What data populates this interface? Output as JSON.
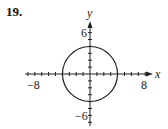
{
  "problem": {
    "number": "19."
  },
  "graph": {
    "x_axis_label": "x",
    "y_axis_label": "y",
    "tick_labels": {
      "x_min": "−8",
      "x_max": "8",
      "y_max": "6",
      "y_min": "−6"
    },
    "colors": {
      "stroke": "#222222",
      "background": "#ffffff"
    }
  },
  "chart_data": {
    "type": "line",
    "title": "",
    "xlabel": "x",
    "ylabel": "y",
    "xlim": [
      -9,
      9
    ],
    "ylim": [
      -7,
      7
    ],
    "grid": false,
    "tick_step": 1,
    "labeled_ticks": {
      "x": [
        -8,
        8
      ],
      "y": [
        6,
        -6
      ]
    },
    "series": [
      {
        "name": "circle",
        "equation": "x^2 + y^2 = 16",
        "center": [
          0,
          0
        ],
        "radius": 4
      }
    ]
  }
}
